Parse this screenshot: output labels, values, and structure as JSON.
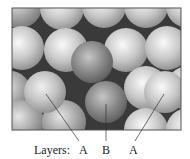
{
  "figure": {
    "caption_prefix": "Layers:",
    "layer_labels": [
      "A",
      "B",
      "A"
    ],
    "colors": {
      "background": "#ffffff",
      "frame": "#555555",
      "gap": "#3a3a3a",
      "sphere_light": "#f4f4f4",
      "sphere_mid": "#b8b8b8",
      "sphere_dark": "#6e6e6e",
      "leader_line": "#333333"
    }
  }
}
